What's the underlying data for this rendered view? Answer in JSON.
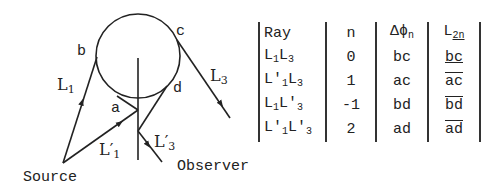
{
  "diagram": {
    "points": {
      "a": "a",
      "b": "b",
      "c": "c",
      "d": "d"
    },
    "labels": {
      "source": "Source",
      "observer": "Observer",
      "L1": "L",
      "L1_sub": "1",
      "L1p": "L′",
      "L1p_sub": "1",
      "L3": "L",
      "L3_sub": "3",
      "L3p": "L′",
      "L3p_sub": "3"
    }
  },
  "table": {
    "headers": {
      "ray": "Ray",
      "n": "n",
      "dphi": "Δϕ",
      "dphi_sub": "n",
      "l2n": "L",
      "l2n_sub": "2n"
    },
    "rows": [
      {
        "ray_a": "L",
        "ray_a_sub": "1",
        "ray_b": "L",
        "ray_b_sub": "3",
        "n": "0",
        "dphi": "bc",
        "l2n": "bc"
      },
      {
        "ray_a": "L′",
        "ray_a_sub": "1",
        "ray_b": "L",
        "ray_b_sub": "3",
        "n": "1",
        "dphi": "ac",
        "l2n": "ac"
      },
      {
        "ray_a": "L",
        "ray_a_sub": "1",
        "ray_b": "L′",
        "ray_b_sub": "3",
        "n": "-1",
        "dphi": "bd",
        "l2n": "bd"
      },
      {
        "ray_a": "L′",
        "ray_a_sub": "1",
        "ray_b": "L′",
        "ray_b_sub": "3",
        "n": "2",
        "dphi": "ad",
        "l2n": "ad"
      }
    ]
  }
}
